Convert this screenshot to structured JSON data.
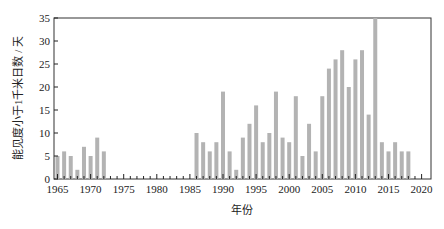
{
  "chart_data": {
    "type": "bar",
    "title": "",
    "xlabel": "年份",
    "ylabel": "能见度小于1千米日数 / 天",
    "xlim": [
      1964.5,
      2021
    ],
    "ylim": [
      0,
      35
    ],
    "xticks": [
      1965,
      1970,
      1975,
      1980,
      1985,
      1990,
      1995,
      2000,
      2005,
      2010,
      2015,
      2020
    ],
    "yticks": [
      0,
      5,
      10,
      15,
      20,
      25,
      30,
      35
    ],
    "grid": false,
    "legend": null,
    "bar_color": "#b3b3b3",
    "categories": [
      1965,
      1966,
      1967,
      1968,
      1969,
      1970,
      1971,
      1972,
      1973,
      1974,
      1975,
      1976,
      1977,
      1978,
      1979,
      1980,
      1981,
      1982,
      1983,
      1984,
      1985,
      1986,
      1987,
      1988,
      1989,
      1990,
      1991,
      1992,
      1993,
      1994,
      1995,
      1996,
      1997,
      1998,
      1999,
      2000,
      2001,
      2002,
      2003,
      2004,
      2005,
      2006,
      2007,
      2008,
      2009,
      2010,
      2011,
      2012,
      2013,
      2014,
      2015,
      2016,
      2017,
      2018
    ],
    "values": [
      5,
      6,
      5,
      2,
      7,
      5,
      9,
      6,
      0,
      0,
      0,
      0,
      0,
      0,
      0,
      0,
      0,
      0,
      0,
      0,
      0,
      10,
      8,
      6,
      8,
      19,
      6,
      2,
      9,
      12,
      16,
      8,
      10,
      19,
      9,
      8,
      18,
      5,
      12,
      6,
      18,
      24,
      26,
      28,
      20,
      26,
      28,
      14,
      35,
      8,
      6,
      8,
      6,
      6
    ]
  }
}
